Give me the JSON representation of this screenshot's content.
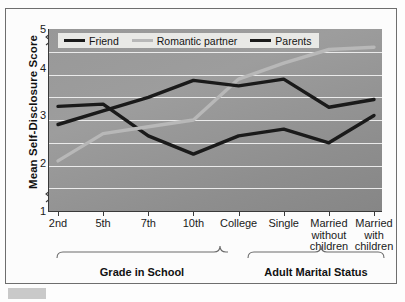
{
  "chart_data": {
    "type": "line",
    "title": "",
    "xlabel": "",
    "ylabel": "Mean Self-Disclosure Score",
    "categories": [
      "2nd",
      "5th",
      "7th",
      "10th",
      "College",
      "Single",
      "Married without children",
      "Married with children"
    ],
    "ylim": [
      1,
      5
    ],
    "yticks": [
      1,
      2,
      3,
      4,
      5
    ],
    "axis_breaks": [
      "1-2",
      "4-5"
    ],
    "grid": true,
    "legend_position": "top-left-inside",
    "series": [
      {
        "name": "Friend",
        "color": "#1a1a1a",
        "values": [
          3.3,
          3.35,
          2.65,
          2.25,
          2.65,
          2.8,
          2.5,
          3.1
        ]
      },
      {
        "name": "Romantic partner",
        "color": "#b8b8b8",
        "values": [
          2.1,
          2.7,
          2.85,
          3.0,
          3.9,
          4.25,
          4.55,
          4.6
        ]
      },
      {
        "name": "Parents",
        "color": "#1a1a1a",
        "values": [
          2.9,
          3.2,
          3.5,
          3.87,
          3.75,
          3.9,
          3.28,
          3.45
        ]
      }
    ],
    "group_axis": [
      {
        "label": "Grade in School",
        "categories": [
          "2nd",
          "5th",
          "7th",
          "10th",
          "College"
        ]
      },
      {
        "label": "Adult Marital Status",
        "categories": [
          "Single",
          "Married without children",
          "Married with children"
        ]
      }
    ]
  },
  "axis": {
    "y_title": "Mean Self-Disclosure Score",
    "y_tick_5": "5",
    "y_tick_4": "4",
    "y_tick_3": "3",
    "y_tick_2": "2",
    "y_tick_1": "1"
  },
  "x_labels": [
    {
      "line1": "2nd",
      "line2": "",
      "line3": ""
    },
    {
      "line1": "5th",
      "line2": "",
      "line3": ""
    },
    {
      "line1": "7th",
      "line2": "",
      "line3": ""
    },
    {
      "line1": "10th",
      "line2": "",
      "line3": ""
    },
    {
      "line1": "College",
      "line2": "",
      "line3": ""
    },
    {
      "line1": "Single",
      "line2": "",
      "line3": ""
    },
    {
      "line1": "Married",
      "line2": "without",
      "line3": "children"
    },
    {
      "line1": "Married",
      "line2": "with",
      "line3": "children"
    }
  ],
  "legend": {
    "items": [
      {
        "label": "Friend",
        "color": "#1a1a1a"
      },
      {
        "label": "Romantic partner",
        "color": "#b8b8b8"
      },
      {
        "label": "Parents",
        "color": "#1a1a1a"
      }
    ]
  },
  "groups": {
    "school": "Grade in School",
    "marital": "Adult Marital Status"
  }
}
